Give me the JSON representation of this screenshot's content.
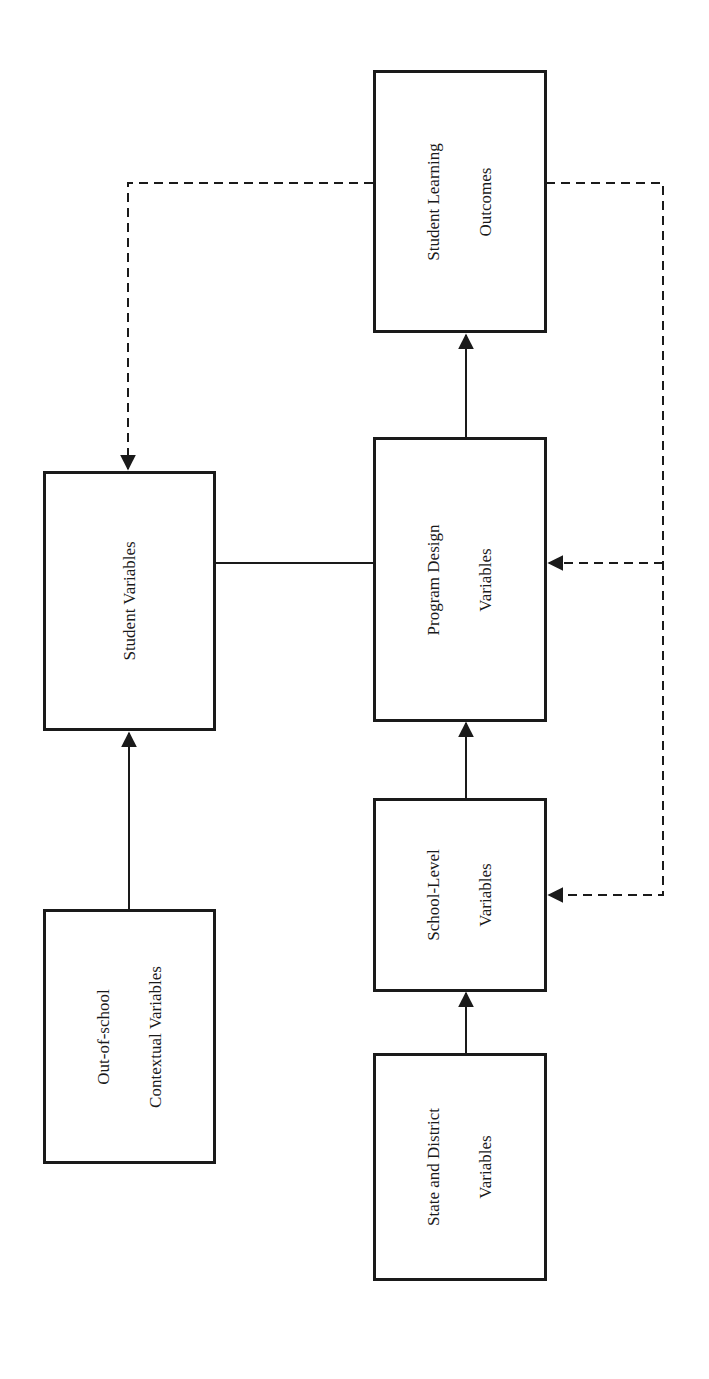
{
  "diagram": {
    "orientation": "rotated-90-counterclockwise",
    "nodes": [
      {
        "id": "outcomes",
        "lines": [
          "Student Learning",
          "Outcomes"
        ]
      },
      {
        "id": "student",
        "lines": [
          "Student Variables"
        ]
      },
      {
        "id": "program",
        "lines": [
          "Program Design",
          "Variables"
        ]
      },
      {
        "id": "school",
        "lines": [
          "School-Level",
          "Variables"
        ]
      },
      {
        "id": "context",
        "lines": [
          "Out-of-school",
          "Contextual Variables"
        ]
      },
      {
        "id": "state",
        "lines": [
          "State and District",
          "Variables"
        ]
      }
    ],
    "edges": [
      {
        "from": "context",
        "to": "student",
        "style": "solid",
        "arrow": true
      },
      {
        "from": "student",
        "to": "program",
        "style": "solid",
        "arrow": false
      },
      {
        "from": "state",
        "to": "school",
        "style": "solid",
        "arrow": true
      },
      {
        "from": "school",
        "to": "program",
        "style": "solid",
        "arrow": true
      },
      {
        "from": "program",
        "to": "outcomes",
        "style": "solid",
        "arrow": true
      },
      {
        "from": "outcomes",
        "to": "student",
        "style": "dashed",
        "arrow": true
      },
      {
        "from": "outcomes",
        "to": "program",
        "style": "dashed",
        "arrow": true
      },
      {
        "from": "outcomes",
        "to": "school",
        "style": "dashed",
        "arrow": true
      }
    ],
    "colors": {
      "stroke": "#1a1a1a",
      "background": "#ffffff"
    }
  }
}
